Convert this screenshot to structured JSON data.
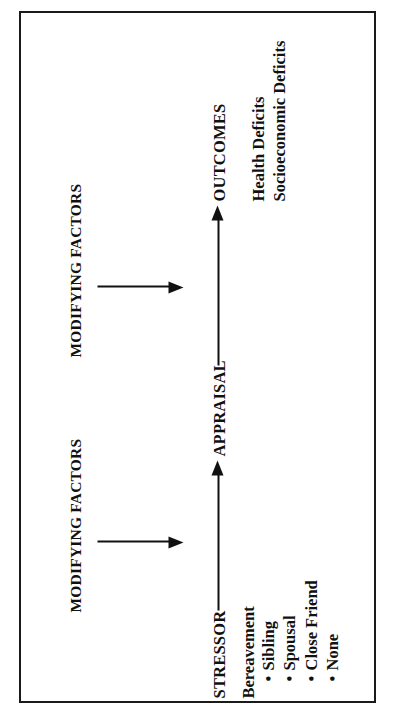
{
  "figure": {
    "type": "flow-diagram",
    "orientation": "rotated-90-ccw",
    "stages": [
      {
        "id": "stressor",
        "label": "STRESSOR"
      },
      {
        "id": "appraisal",
        "label": "APPRAISAL"
      },
      {
        "id": "outcomes",
        "label": "OUTCOMES"
      }
    ],
    "stressor_group": {
      "heading": "Bereavement",
      "bullet_glyph": "•",
      "items": [
        "Sibling",
        "Spousal",
        "Close Friend",
        "None"
      ]
    },
    "outcomes_group": {
      "items": [
        "Health Deficits",
        "Socioeconomic Deficits"
      ]
    },
    "modifiers": [
      {
        "id": "modifying-factors-1",
        "label": "MODIFYING FACTORS"
      },
      {
        "id": "modifying-factors-2",
        "label": "MODIFYING FACTORS"
      }
    ],
    "connectors": [
      {
        "id": "stressor-to-appraisal",
        "from": "STRESSOR",
        "to": "APPRAISAL",
        "style": "arrow"
      },
      {
        "id": "appraisal-to-outcomes",
        "from": "APPRAISAL",
        "to": "OUTCOMES",
        "style": "arrow"
      },
      {
        "id": "modifier-1-into-flow",
        "from": "MODIFYING FACTORS",
        "to": "STRESSOR→APPRAISAL path",
        "style": "arrow"
      },
      {
        "id": "modifier-2-into-flow",
        "from": "MODIFYING FACTORS",
        "to": "APPRAISAL→OUTCOMES path",
        "style": "arrow"
      }
    ],
    "colors": {
      "ink": "#111111",
      "border": "#1a1a1a",
      "paper": "#ffffff"
    }
  }
}
